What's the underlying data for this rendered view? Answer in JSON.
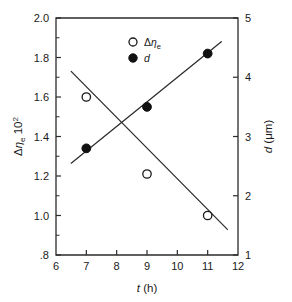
{
  "chart_data": {
    "type": "scatter",
    "title": "",
    "xlabel": "t (h)",
    "xlabel_italic": "t",
    "xlabel_unit": "(h)",
    "ylabel_left": "Δηe 10²",
    "ylabel_right": "d (μm)",
    "xlim": [
      6,
      12
    ],
    "ylim_left": [
      0.8,
      2.0
    ],
    "ylim_right": [
      1,
      5
    ],
    "grid": false,
    "legend_position": "top-center",
    "x_ticks": [
      "6",
      "7",
      "8",
      "9",
      "10",
      "11",
      "12"
    ],
    "x_tick_values": [
      6,
      7,
      8,
      9,
      10,
      11,
      12
    ],
    "y_ticks_left": [
      ".8",
      "1.0",
      "1.2",
      "1.4",
      "1.6",
      "1.8",
      "2.0"
    ],
    "y_tick_values_left": [
      0.8,
      1.0,
      1.2,
      1.4,
      1.6,
      1.8,
      2.0
    ],
    "y_minor_values_left": [
      0.9,
      1.1,
      1.3,
      1.5,
      1.7,
      1.9
    ],
    "y_ticks_right": [
      "1",
      "2",
      "3",
      "4",
      "5"
    ],
    "y_tick_values_right": [
      1,
      2,
      3,
      4,
      5
    ],
    "series": [
      {
        "name": "Δηe",
        "marker": "open-circle",
        "axis": "left",
        "x": [
          7,
          9,
          11
        ],
        "values": [
          1.6,
          1.21,
          1.0
        ],
        "trend_x": [
          6.5,
          11.65
        ],
        "trend_y": [
          1.73,
          0.93
        ]
      },
      {
        "name": "d",
        "marker": "filled-circle",
        "axis": "right",
        "x": [
          7,
          9,
          11
        ],
        "values": [
          2.8,
          3.5,
          4.4
        ],
        "trend_x": [
          6.5,
          11.45
        ],
        "trend_y": [
          2.55,
          4.6
        ]
      }
    ],
    "legend": [
      {
        "label": "Δηe",
        "marker": "open-circle"
      },
      {
        "label": "d",
        "marker": "filled-circle"
      }
    ]
  }
}
